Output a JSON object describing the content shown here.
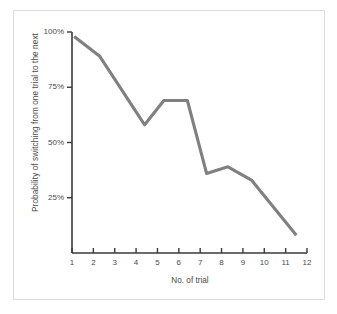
{
  "chart_data": {
    "type": "line",
    "title": "",
    "xlabel": "No. of trial",
    "ylabel": "Probability of switching from one trial to the next",
    "xlim": [
      1,
      12
    ],
    "ylim": [
      0,
      100
    ],
    "grid": false,
    "legend": "none",
    "line_color": "#808080",
    "axis_color": "#3a3a3a",
    "x_ticks": [
      "1",
      "2",
      "3",
      "4",
      "5",
      "6",
      "7",
      "8",
      "9",
      "10",
      "11",
      "12"
    ],
    "x_tick_values": [
      1,
      2,
      3,
      4,
      5,
      6,
      7,
      8,
      9,
      10,
      11,
      12
    ],
    "y_ticks": [
      "25%",
      "50%",
      "75%",
      "100%"
    ],
    "y_tick_values": [
      25,
      50,
      75,
      100
    ],
    "series": [
      {
        "name": "Probability of switching",
        "x": [
          1.1,
          2.3,
          4.4,
          5.3,
          6.4,
          7.3,
          8.3,
          9.4,
          11.5
        ],
        "values": [
          98,
          89,
          58,
          69,
          69,
          36,
          39,
          33,
          8
        ]
      }
    ]
  },
  "figure": {
    "frame_color": "#dddddd",
    "background": "#ffffff"
  }
}
